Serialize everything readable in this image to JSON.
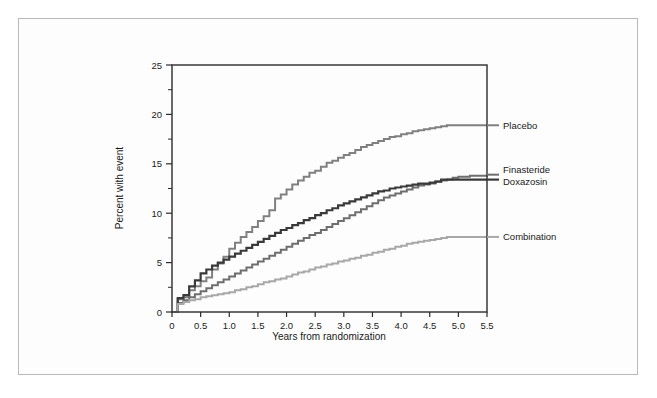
{
  "figure": {
    "background_color": "#fdfdfd",
    "frame_color": "#b9b9b9",
    "plot_border_color": "#2b2b2b"
  },
  "chart_data": {
    "type": "line",
    "title": "",
    "subtitle": "",
    "xlabel": "Years from randomization",
    "ylabel": "Percent with event",
    "xlim": [
      0,
      5.5
    ],
    "ylim": [
      0,
      25
    ],
    "xticks": [
      0,
      0.5,
      1.0,
      1.5,
      2.0,
      2.5,
      3.0,
      3.5,
      4.0,
      4.5,
      5.0,
      5.5
    ],
    "xtick_labels": [
      "0",
      "0.5",
      "1.0",
      "1.5",
      "2.0",
      "2.5",
      "3.0",
      "3.5",
      "4.0",
      "4.5",
      "5.0",
      "5.5"
    ],
    "yticks": [
      0,
      5,
      10,
      15,
      20,
      25
    ],
    "ytick_labels": [
      "0",
      "5",
      "10",
      "15",
      "20",
      "25"
    ],
    "yminorticks": [
      2.5,
      7.5,
      12.5,
      17.5,
      22.5
    ],
    "grid": false,
    "legend_position": "right-inline",
    "step_style": "post",
    "series": [
      {
        "name": "Placebo",
        "color": "#808080",
        "line_width": 2.0,
        "label_y_value": 18.9,
        "x": [
          0,
          0.1,
          0.2,
          0.3,
          0.4,
          0.5,
          0.6,
          0.7,
          0.8,
          0.9,
          1.0,
          1.1,
          1.2,
          1.3,
          1.4,
          1.5,
          1.6,
          1.7,
          1.8,
          1.9,
          2.0,
          2.1,
          2.2,
          2.3,
          2.4,
          2.5,
          2.6,
          2.7,
          2.8,
          2.9,
          3.0,
          3.1,
          3.2,
          3.3,
          3.4,
          3.5,
          3.6,
          3.7,
          3.8,
          3.9,
          4.0,
          4.1,
          4.2,
          4.3,
          4.4,
          4.5,
          4.6,
          4.7,
          4.8,
          5.0,
          5.5
        ],
        "values": [
          0,
          1.3,
          1.5,
          2.2,
          2.6,
          3.1,
          3.5,
          4.3,
          4.9,
          5.6,
          6.4,
          7.0,
          7.6,
          8.1,
          8.6,
          9.2,
          9.7,
          10.3,
          11.5,
          11.9,
          12.4,
          12.9,
          13.3,
          13.7,
          14.1,
          14.3,
          14.7,
          15.1,
          15.3,
          15.6,
          15.9,
          16.1,
          16.4,
          16.7,
          16.9,
          17.1,
          17.3,
          17.5,
          17.7,
          17.8,
          18.0,
          18.1,
          18.3,
          18.4,
          18.5,
          18.6,
          18.7,
          18.8,
          18.9,
          18.9,
          18.9
        ]
      },
      {
        "name": "Finasteride",
        "color": "#6e6e6e",
        "line_width": 2.0,
        "label_y_value": 13.9,
        "x": [
          0,
          0.1,
          0.2,
          0.3,
          0.4,
          0.5,
          0.6,
          0.7,
          0.8,
          0.9,
          1.0,
          1.1,
          1.2,
          1.3,
          1.4,
          1.5,
          1.6,
          1.7,
          1.8,
          1.9,
          2.0,
          2.1,
          2.2,
          2.3,
          2.4,
          2.5,
          2.6,
          2.7,
          2.8,
          2.9,
          3.0,
          3.1,
          3.2,
          3.3,
          3.4,
          3.5,
          3.6,
          3.7,
          3.8,
          3.9,
          4.0,
          4.1,
          4.2,
          4.3,
          4.4,
          4.5,
          4.6,
          4.7,
          4.8,
          4.9,
          5.0,
          5.2,
          5.5
        ],
        "values": [
          0,
          0.9,
          1.2,
          1.5,
          1.8,
          2.1,
          2.4,
          2.7,
          3.0,
          3.3,
          3.6,
          3.9,
          4.2,
          4.5,
          4.8,
          5.1,
          5.4,
          5.7,
          6.0,
          6.3,
          6.6,
          6.9,
          7.2,
          7.5,
          7.8,
          8.0,
          8.3,
          8.6,
          8.9,
          9.2,
          9.5,
          9.8,
          10.1,
          10.4,
          10.7,
          11.0,
          11.3,
          11.6,
          11.8,
          12.0,
          12.2,
          12.4,
          12.6,
          12.8,
          12.9,
          13.0,
          13.2,
          13.3,
          13.4,
          13.6,
          13.7,
          13.8,
          13.9
        ]
      },
      {
        "name": "Doxazosin",
        "color": "#3a3a3a",
        "line_width": 2.2,
        "label_y_value": 13.4,
        "x": [
          0,
          0.1,
          0.2,
          0.3,
          0.4,
          0.5,
          0.6,
          0.7,
          0.8,
          0.9,
          1.0,
          1.1,
          1.2,
          1.3,
          1.4,
          1.5,
          1.6,
          1.7,
          1.8,
          1.9,
          2.0,
          2.1,
          2.2,
          2.3,
          2.4,
          2.5,
          2.6,
          2.7,
          2.8,
          2.9,
          3.0,
          3.1,
          3.2,
          3.3,
          3.4,
          3.5,
          3.6,
          3.7,
          3.8,
          3.9,
          4.0,
          4.1,
          4.2,
          4.3,
          4.4,
          4.5,
          4.6,
          4.7,
          4.8,
          4.9,
          5.0,
          5.2,
          5.5
        ],
        "values": [
          0,
          1.4,
          1.7,
          2.6,
          3.2,
          3.9,
          4.3,
          4.7,
          5.0,
          5.3,
          5.6,
          5.9,
          6.2,
          6.5,
          6.8,
          7.1,
          7.4,
          7.7,
          8.0,
          8.3,
          8.5,
          8.8,
          9.0,
          9.3,
          9.5,
          9.8,
          10.0,
          10.3,
          10.5,
          10.8,
          11.0,
          11.2,
          11.4,
          11.6,
          11.8,
          12.0,
          12.2,
          12.3,
          12.5,
          12.6,
          12.7,
          12.8,
          12.9,
          13.0,
          13.0,
          13.1,
          13.2,
          13.4,
          13.4,
          13.4,
          13.4,
          13.4,
          13.4
        ]
      },
      {
        "name": "Combination",
        "color": "#a8a8a8",
        "line_width": 2.0,
        "label_y_value": 7.6,
        "x": [
          0,
          0.1,
          0.2,
          0.3,
          0.4,
          0.5,
          0.6,
          0.7,
          0.8,
          0.9,
          1.0,
          1.1,
          1.2,
          1.3,
          1.4,
          1.5,
          1.6,
          1.7,
          1.8,
          1.9,
          2.0,
          2.1,
          2.2,
          2.3,
          2.4,
          2.5,
          2.6,
          2.7,
          2.8,
          2.9,
          3.0,
          3.1,
          3.2,
          3.3,
          3.4,
          3.5,
          3.6,
          3.7,
          3.8,
          3.9,
          4.0,
          4.1,
          4.2,
          4.3,
          4.4,
          4.5,
          4.6,
          4.7,
          4.8,
          5.0,
          5.5
        ],
        "values": [
          0,
          0.8,
          1.0,
          1.2,
          1.3,
          1.5,
          1.6,
          1.7,
          1.8,
          1.9,
          2.0,
          2.2,
          2.3,
          2.5,
          2.6,
          2.8,
          3.0,
          3.1,
          3.3,
          3.4,
          3.6,
          3.8,
          4.0,
          4.1,
          4.3,
          4.5,
          4.6,
          4.8,
          4.9,
          5.1,
          5.2,
          5.4,
          5.5,
          5.7,
          5.8,
          6.0,
          6.1,
          6.3,
          6.4,
          6.6,
          6.7,
          6.9,
          7.0,
          7.1,
          7.2,
          7.3,
          7.4,
          7.5,
          7.6,
          7.6,
          7.6
        ]
      }
    ]
  }
}
